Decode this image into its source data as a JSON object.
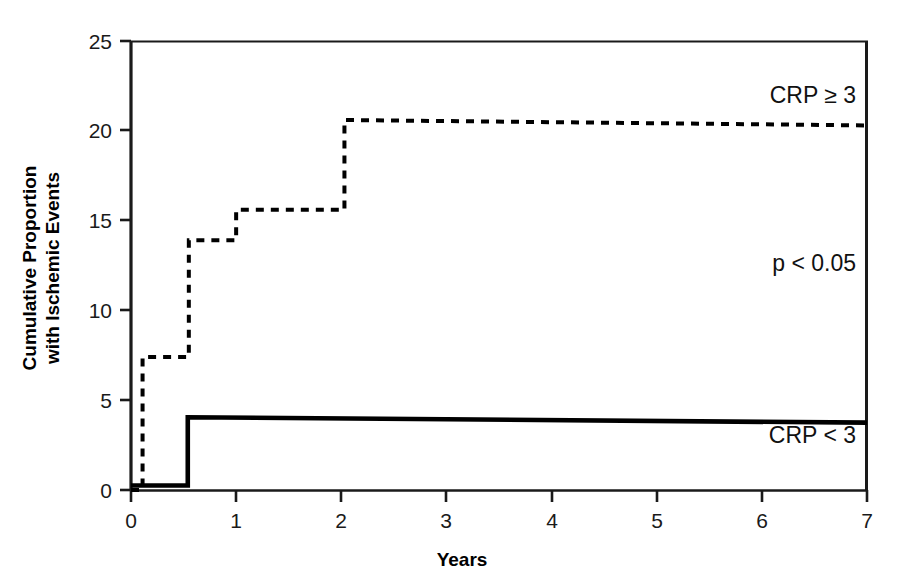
{
  "chart_data": {
    "type": "line",
    "subtype": "kaplan-meier-step",
    "title": "",
    "xlabel": "Years",
    "ylabel": "Cumulative Proportion with Ischemic Events",
    "ylabel_lines": [
      "Cumulative Proportion",
      "with Ischemic Events"
    ],
    "xlim": [
      0,
      7
    ],
    "ylim": [
      0,
      25
    ],
    "xticks": [
      0,
      1,
      2,
      3,
      4,
      5,
      6,
      7
    ],
    "xtick_labels": [
      "0",
      "1",
      "2",
      "3",
      "4",
      "5",
      "6",
      "7"
    ],
    "yticks": [
      0,
      5,
      10,
      15,
      20,
      25
    ],
    "ytick_labels": [
      "0",
      "5",
      "10",
      "15",
      "20",
      "25"
    ],
    "grid": false,
    "legend_position": "inline-annotation",
    "series": [
      {
        "name": "CRP ≥ 3",
        "style": "dashed",
        "color": "#000000",
        "label_text": "CRP ≥ 3",
        "points": [
          {
            "x": 0.0,
            "y": 0.0
          },
          {
            "x": 0.11,
            "y": 0.0
          },
          {
            "x": 0.11,
            "y": 7.4
          },
          {
            "x": 0.55,
            "y": 7.4
          },
          {
            "x": 0.55,
            "y": 13.9
          },
          {
            "x": 1.0,
            "y": 13.9
          },
          {
            "x": 1.0,
            "y": 15.6
          },
          {
            "x": 2.03,
            "y": 15.6
          },
          {
            "x": 2.03,
            "y": 20.6
          },
          {
            "x": 7.0,
            "y": 20.3
          }
        ]
      },
      {
        "name": "CRP < 3",
        "style": "solid",
        "color": "#000000",
        "label_text": "CRP < 3",
        "points": [
          {
            "x": 0.0,
            "y": 0.25
          },
          {
            "x": 0.54,
            "y": 0.25
          },
          {
            "x": 0.54,
            "y": 4.05
          },
          {
            "x": 7.0,
            "y": 3.75
          }
        ]
      }
    ],
    "annotations": [
      {
        "id": "crp-high-label",
        "text": "CRP ≥ 3",
        "x": 6.55,
        "y": 22.2
      },
      {
        "id": "pvalue-label",
        "text": "p < 0.05",
        "x": 6.5,
        "y": 11.5
      },
      {
        "id": "crp-low-label",
        "text": "CRP < 3",
        "x": 6.5,
        "y": 2.5
      }
    ]
  },
  "axes": {
    "x_axis_title": "Years",
    "y_axis_title_line1": "Cumulative Proportion",
    "y_axis_title_line2": "with Ischemic Events"
  },
  "tick_labels": {
    "y": [
      "25",
      "20",
      "15",
      "10",
      "5",
      "0"
    ],
    "x": [
      "0",
      "1",
      "2",
      "3",
      "4",
      "5",
      "6",
      "7"
    ]
  },
  "annotations": {
    "crp_high": "CRP ≥ 3",
    "pvalue": "p < 0.05",
    "crp_low": "CRP < 3"
  },
  "colors": {
    "line": "#000000",
    "axis": "#1a1a1a",
    "background": "#ffffff",
    "text": "#111111"
  }
}
